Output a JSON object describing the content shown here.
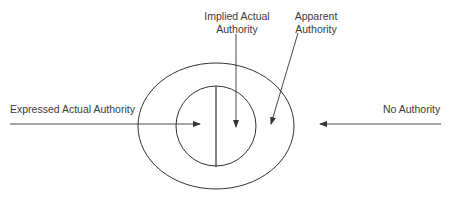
{
  "diagram": {
    "type": "nested-regions",
    "labels": {
      "expressed": "Expressed Actual Authority",
      "implied_line1": "Implied Actual",
      "implied_line2": "Authority",
      "apparent_line1": "Apparent",
      "apparent_line2": "Authority",
      "none": "No Authority"
    },
    "regions": [
      {
        "name": "outer-ellipse",
        "meaning": "Apparent Authority"
      },
      {
        "name": "inner-circle-left-half",
        "meaning": "Expressed Actual Authority"
      },
      {
        "name": "inner-circle-right-half",
        "meaning": "Implied Actual Authority"
      },
      {
        "name": "outside",
        "meaning": "No Authority"
      }
    ],
    "colors": {
      "stroke": "#333333",
      "text": "#3a3a3a",
      "background": "#ffffff"
    }
  }
}
